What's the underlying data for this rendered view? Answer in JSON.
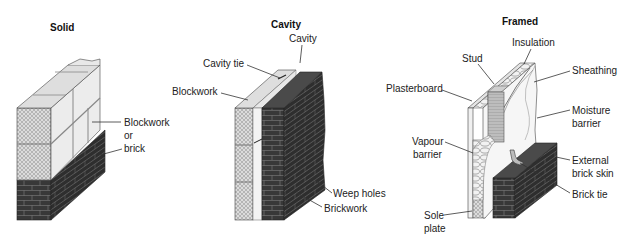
{
  "diagram": {
    "panels": [
      {
        "id": "solid",
        "title": "Solid",
        "labels": [
          {
            "lines": [
              "Blockwork",
              "or",
              "brick"
            ]
          }
        ]
      },
      {
        "id": "cavity",
        "title": "Cavity",
        "labels": [
          {
            "lines": [
              "Cavity"
            ]
          },
          {
            "lines": [
              "Cavity tie"
            ]
          },
          {
            "lines": [
              "Blockwork"
            ]
          },
          {
            "lines": [
              "Weep holes"
            ]
          },
          {
            "lines": [
              "Brickwork"
            ]
          }
        ]
      },
      {
        "id": "framed",
        "title": "Framed",
        "labels": [
          {
            "lines": [
              "Insulation"
            ]
          },
          {
            "lines": [
              "Stud"
            ]
          },
          {
            "lines": [
              "Sheathing"
            ]
          },
          {
            "lines": [
              "Plasterboard"
            ]
          },
          {
            "lines": [
              "Moisture",
              "barrier"
            ]
          },
          {
            "lines": [
              "Vapour",
              "barrier"
            ]
          },
          {
            "lines": [
              "External",
              "brick skin"
            ]
          },
          {
            "lines": [
              "Brick tie"
            ]
          },
          {
            "lines": [
              "Sole",
              "plate"
            ]
          }
        ]
      }
    ]
  },
  "colors": {
    "brick": "#3a3a3a",
    "brick_side": "#2b2b2b",
    "block_face": "#e6e6e6",
    "block_top": "#d9d9d9",
    "hatch": "#bdbdbd",
    "line": "#333333"
  }
}
